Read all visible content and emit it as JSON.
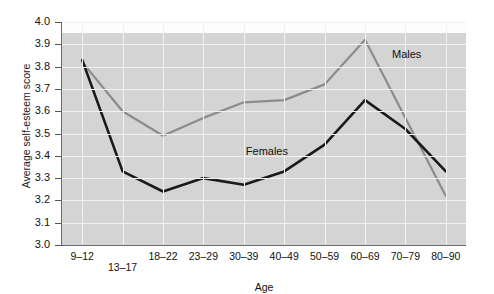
{
  "chart_data": {
    "type": "line",
    "title": "",
    "xlabel": "Age",
    "ylabel": "Average self-esteem score",
    "categories": [
      "9–12",
      "13–17",
      "18–22",
      "23–29",
      "30–39",
      "40–49",
      "50–59",
      "60–69",
      "70–79",
      "80–90"
    ],
    "ylim": [
      3.0,
      4.0
    ],
    "ytick_labels": [
      "4.0",
      "3.9",
      "3.8",
      "3.7",
      "3.6",
      "3.5",
      "3.4",
      "3.3",
      "3.2",
      "3.1",
      "3.0"
    ],
    "ytick_values": [
      4.0,
      3.9,
      3.8,
      3.7,
      3.6,
      3.5,
      3.4,
      3.3,
      3.2,
      3.1,
      3.0
    ],
    "grid": true,
    "legend_position": "inline-annotation",
    "series": [
      {
        "name": "Males",
        "color": "#8c8c8c",
        "values": [
          3.82,
          3.6,
          3.49,
          3.57,
          3.64,
          3.65,
          3.72,
          3.92,
          3.57,
          3.22
        ]
      },
      {
        "name": "Females",
        "color": "#1a1a1a",
        "values": [
          3.83,
          3.33,
          3.24,
          3.3,
          3.27,
          3.33,
          3.45,
          3.65,
          3.52,
          3.33
        ]
      }
    ],
    "annotations": [
      {
        "text": "Males",
        "series": "Males"
      },
      {
        "text": "Females",
        "series": "Females"
      }
    ]
  }
}
